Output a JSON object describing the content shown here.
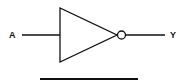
{
  "diagram": {
    "type": "logic-gate",
    "gate": "NOT",
    "input_label": "A",
    "output_label": "Y",
    "colors": {
      "stroke": "#111111",
      "background": "#ffffff"
    }
  }
}
